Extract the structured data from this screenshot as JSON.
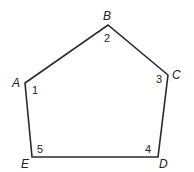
{
  "diagram": {
    "type": "pentagon",
    "stroke_color": "#2a2a2a",
    "vertices": [
      {
        "name": "A",
        "x": 25,
        "y": 83,
        "label_x": 12,
        "label_y": 87,
        "angle_label": "1",
        "angle_x": 32,
        "angle_y": 94
      },
      {
        "name": "B",
        "x": 108,
        "y": 25,
        "label_x": 103,
        "label_y": 20,
        "angle_label": "2",
        "angle_x": 104,
        "angle_y": 42
      },
      {
        "name": "C",
        "x": 168,
        "y": 75,
        "label_x": 172,
        "label_y": 79,
        "angle_label": "3",
        "angle_x": 156,
        "angle_y": 83
      },
      {
        "name": "D",
        "x": 158,
        "y": 157,
        "label_x": 159,
        "label_y": 168,
        "angle_label": "4",
        "angle_x": 145,
        "angle_y": 153
      },
      {
        "name": "E",
        "x": 32,
        "y": 157,
        "label_x": 21,
        "label_y": 168,
        "angle_label": "5",
        "angle_x": 37,
        "angle_y": 153
      }
    ]
  }
}
